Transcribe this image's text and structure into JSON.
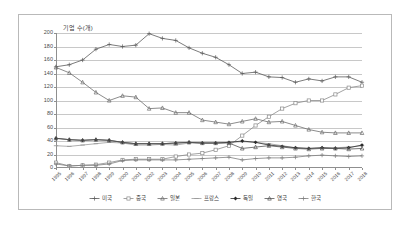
{
  "chart_data": {
    "type": "line",
    "title": "",
    "ylabel": "기업 수(개)",
    "xlabel": "",
    "ylim": [
      0,
      200
    ],
    "ytick_step": 20,
    "yticks": [
      0,
      20,
      40,
      60,
      80,
      100,
      120,
      140,
      160,
      180,
      200
    ],
    "grid": true,
    "legend_position": "bottom",
    "categories": [
      "1995",
      "1996",
      "1997",
      "1998",
      "1999",
      "2000",
      "2001",
      "2002",
      "2003",
      "2004",
      "2005",
      "2006",
      "2007",
      "2008",
      "2009",
      "2010",
      "2011",
      "2012",
      "2013",
      "2014",
      "2015",
      "2016",
      "2017",
      "2018"
    ],
    "series": [
      {
        "name": "미국",
        "color": "#5a5a5a",
        "marker": "plus",
        "values": [
          150,
          153,
          160,
          176,
          183,
          180,
          182,
          199,
          192,
          189,
          178,
          170,
          164,
          153,
          140,
          142,
          135,
          134,
          127,
          132,
          129,
          135,
          135,
          127
        ]
      },
      {
        "name": "중국",
        "color": "#8a8a8a",
        "marker": "square",
        "values": [
          8,
          3,
          4,
          5,
          8,
          12,
          13,
          13,
          13,
          17,
          20,
          22,
          27,
          33,
          48,
          63,
          76,
          88,
          96,
          100,
          100,
          109,
          119,
          122
        ]
      },
      {
        "name": "일본",
        "color": "#6f6f6f",
        "marker": "triangle",
        "values": [
          149,
          141,
          127,
          112,
          100,
          107,
          105,
          88,
          89,
          82,
          82,
          71,
          68,
          65,
          69,
          73,
          68,
          69,
          63,
          57,
          53,
          52,
          52,
          52
        ]
      },
      {
        "name": "프랑스",
        "color": "#9a9a9a",
        "marker": "dash",
        "values": [
          33,
          32,
          34,
          36,
          38,
          37,
          34,
          34,
          35,
          34,
          37,
          37,
          37,
          38,
          39,
          38,
          36,
          33,
          30,
          29,
          30,
          30,
          31,
          33
        ]
      },
      {
        "name": "독일",
        "color": "#2b2b2b",
        "marker": "diamond",
        "values": [
          44,
          42,
          41,
          42,
          41,
          38,
          36,
          36,
          36,
          37,
          38,
          37,
          37,
          38,
          40,
          38,
          34,
          32,
          30,
          29,
          30,
          29,
          30,
          34
        ]
      },
      {
        "name": "영국",
        "color": "#555555",
        "marker": "triangle",
        "values": [
          44,
          42,
          41,
          42,
          41,
          38,
          36,
          36,
          36,
          37,
          38,
          37,
          37,
          37,
          29,
          31,
          33,
          31,
          29,
          28,
          29,
          29,
          28,
          29
        ]
      },
      {
        "name": "한국",
        "color": "#7d7d7d",
        "marker": "plus",
        "values": [
          6,
          3,
          4,
          4,
          6,
          11,
          12,
          12,
          12,
          12,
          13,
          14,
          15,
          16,
          12,
          14,
          15,
          15,
          16,
          18,
          19,
          18,
          17,
          18
        ]
      }
    ]
  }
}
